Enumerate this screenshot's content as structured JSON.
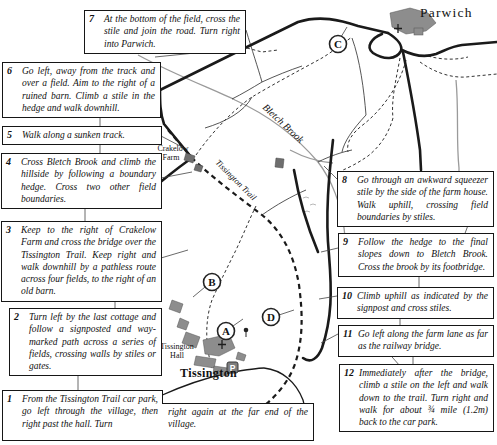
{
  "map": {
    "labels": {
      "parwich": "Parwich",
      "crakelow_line1": "Crakelow",
      "crakelow_line2": "Farm",
      "tissington_trail": "Tissington Trail",
      "bletch_brook": "Bletch Brook",
      "hall_line1": "Tissington",
      "hall_line2": "Hall",
      "tissington": "Tissington",
      "parking": "P"
    },
    "markers": {
      "a": "A",
      "b": "B",
      "c": "C",
      "d": "D"
    },
    "colors": {
      "road": "#1a1a1a",
      "brook": "#9a9a9a",
      "building": "#8d8d8d",
      "text": "#111111"
    }
  },
  "instructions": {
    "i1": {
      "num": "1",
      "text_left": "From the Tissington Trail car park, go left through the village, then right past the hall. Turn",
      "text_right": "right again at the far end of the village."
    },
    "i2": {
      "num": "2",
      "text": "Turn left by the last cottage and follow a signposted and way-marked path across a series of fields, crossing walls by stiles or gates."
    },
    "i3": {
      "num": "3",
      "text": "Keep to the right of Crakelow Farm and cross the bridge over the Tissington Trail. Keep right and walk downhill by a pathless route across four fields, to the right of an old barn."
    },
    "i4": {
      "num": "4",
      "text": "Cross Bletch Brook and climb the hillside by following a boundary hedge. Cross two other field boundaries."
    },
    "i5": {
      "num": "5",
      "text": "Walk along a sunken track."
    },
    "i6": {
      "num": "6",
      "text": "Go left, away from the track and over a field. Aim to the right of a ruined barn. Climb a stile in the hedge and walk downhill."
    },
    "i7": {
      "num": "7",
      "text": "At the bottom of the field, cross the stile and join the road. Turn right into Parwich."
    },
    "i8": {
      "num": "8",
      "text": "Go through an awkward squeezer stile by the side of the farm house. Walk uphill, crossing field boundaries by stiles."
    },
    "i9": {
      "num": "9",
      "text": "Follow the hedge to the final slopes down to Bletch Brook. Cross the brook by its footbridge."
    },
    "i10": {
      "num": "10",
      "text": "Climb uphill as indicated by the signpost and cross stiles."
    },
    "i11": {
      "num": "11",
      "text": "Go left along the farm lane as far as the railway bridge."
    },
    "i12": {
      "num": "12",
      "text": "Immediately after the bridge, climb a stile on the left and walk down to the trail. Turn right and walk for about ¾ mile (1.2m) back to the car park."
    }
  }
}
